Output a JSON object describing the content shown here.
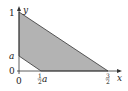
{
  "diagram": {
    "axes": {
      "x_label": "x",
      "y_label": "y",
      "origin_label": "0"
    },
    "y_ticks": [
      {
        "label": "1"
      },
      {
        "label": "a"
      },
      {
        "label": "0"
      }
    ],
    "x_ticks": [
      {
        "label_num": "1",
        "label_den": "2",
        "label_var": "a"
      },
      {
        "label_num": "3",
        "label_den": "2",
        "label_var": ""
      }
    ],
    "region_fill": "#b3b3b3",
    "line_color": "#333333"
  }
}
